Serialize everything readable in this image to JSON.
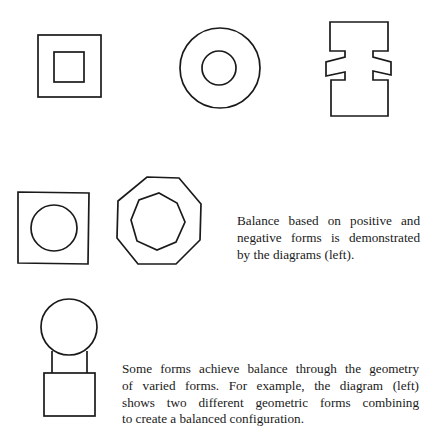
{
  "figures": {
    "row1": [
      {
        "name": "nested-squares",
        "description": "square inside square"
      },
      {
        "name": "concentric-circles",
        "description": "circle inside circle"
      },
      {
        "name": "notched-i-shape",
        "description": "I-shaped form with wedge notches on both sides"
      }
    ],
    "row2": [
      {
        "name": "circle-in-square",
        "description": "circle inside square"
      },
      {
        "name": "nested-octagons",
        "description": "octagon inside octagon"
      }
    ],
    "row3": [
      {
        "name": "circle-on-square",
        "description": "circle joined to square by a neck"
      }
    ]
  },
  "captions": {
    "positive_negative": {
      "lines": [
        "Balance based on positive and",
        "negative forms is demonstrated",
        "by the diagrams (left)."
      ]
    },
    "varied_forms": {
      "lines": [
        "Some forms achieve balance through the geometry",
        "of varied forms. For example,  the  diagram (left)",
        "shows two different geometric forms combining",
        "to create a balanced configuration."
      ]
    }
  },
  "colors": {
    "background": "#ffffff",
    "ink": "#1a1a1a"
  }
}
